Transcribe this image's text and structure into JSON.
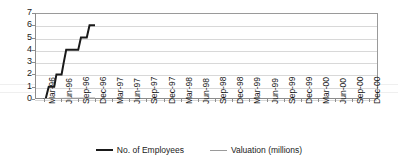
{
  "chart_data": {
    "type": "line",
    "title": "",
    "xlabel": "",
    "ylabel": "",
    "ylim": [
      0,
      7
    ],
    "yticks": [
      0,
      1,
      2,
      3,
      4,
      5,
      6,
      7
    ],
    "grid": true,
    "legend_position": "bottom",
    "categories": [
      "Mar-96",
      "Jun-96",
      "Sep-96",
      "Dec-96",
      "Mar-97",
      "Jun-97",
      "Sep-97",
      "Dec-97",
      "Mar-98",
      "Jun-98",
      "Sep-98",
      "Dec-98",
      "Mar-99",
      "Jun-99",
      "Sep-99",
      "Dec-99",
      "Mar-00",
      "Jun-00",
      "Sep-00",
      "Dec-00"
    ],
    "series": [
      {
        "name": "No. of Employees",
        "color": "#1a1a1a",
        "points": [
          {
            "x": 0.0,
            "y": 0
          },
          {
            "x": 0.12,
            "y": 0
          },
          {
            "x": 0.3,
            "y": 1
          },
          {
            "x": 0.62,
            "y": 1
          },
          {
            "x": 0.75,
            "y": 2
          },
          {
            "x": 1.05,
            "y": 2
          },
          {
            "x": 1.18,
            "y": 3
          },
          {
            "x": 1.32,
            "y": 4
          },
          {
            "x": 2.02,
            "y": 4
          },
          {
            "x": 2.18,
            "y": 5
          },
          {
            "x": 2.52,
            "y": 5
          },
          {
            "x": 2.68,
            "y": 6
          },
          {
            "x": 3.0,
            "y": 6
          }
        ]
      },
      {
        "name": "Valuation (millions)",
        "color": "#9a9a9a",
        "points": [
          {
            "x": 0.0,
            "y": 0
          },
          {
            "x": 1.5,
            "y": 0.03
          },
          {
            "x": 3.0,
            "y": 0.06
          }
        ]
      }
    ]
  },
  "legend": {
    "items": [
      {
        "label": "No. of Employees",
        "color": "#1a1a1a"
      },
      {
        "label": "Valuation (millions)",
        "color": "#9a9a9a"
      }
    ]
  }
}
